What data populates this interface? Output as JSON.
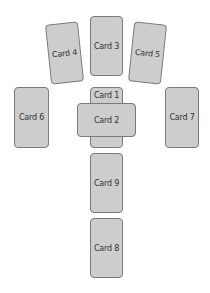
{
  "diagram": {
    "card_color": "#cdcdcd",
    "border_color": "#7a7a7a",
    "cards": [
      {
        "id": "c1",
        "label": "Card 1"
      },
      {
        "id": "c2",
        "label": "Card 2"
      },
      {
        "id": "c3",
        "label": "Card 3"
      },
      {
        "id": "c4",
        "label": "Card 4"
      },
      {
        "id": "c5",
        "label": "Card 5"
      },
      {
        "id": "c6",
        "label": "Card 6"
      },
      {
        "id": "c7",
        "label": "Card 7"
      },
      {
        "id": "c8",
        "label": "Card 8"
      },
      {
        "id": "c9",
        "label": "Card 9"
      }
    ]
  }
}
